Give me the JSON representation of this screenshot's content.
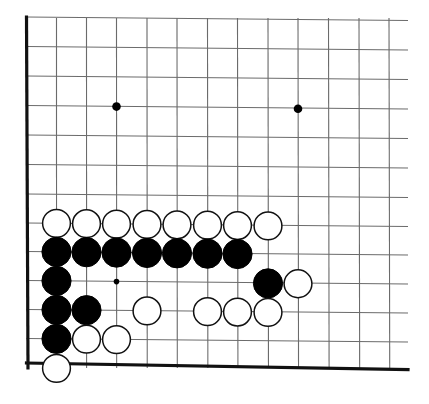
{
  "board": {
    "title": "Go board diagram",
    "type": "go-board-position",
    "board_size": 19,
    "view": "bottom-left corner section, partial board",
    "colors": {
      "background": "#ffffff",
      "grid_line": "#6b6b6b",
      "border_line": "#111111",
      "black_stone": "#000000",
      "white_stone_fill": "#ffffff",
      "white_stone_edge": "#111111",
      "star_point": "#000000"
    },
    "geometry": {
      "col_x": [
        26.5,
        56.5,
        86.5,
        116.5,
        147,
        177,
        207.5,
        237.5,
        268,
        298,
        328.5,
        359,
        389
      ],
      "row_y": [
        17,
        46.5,
        76,
        105.5,
        135,
        164.5,
        194,
        223,
        251.5,
        280.5,
        309.5,
        338.5,
        368
      ],
      "stone_radius": 14.6,
      "left_border_col_index": 0,
      "bottom_border_row_index": 12,
      "top_edge_y": 27,
      "grid_line_width": 1.1,
      "border_line_width": 3.2
    },
    "star_points": [
      {
        "col": 3,
        "row": 3,
        "size": "large"
      },
      {
        "col": 9,
        "row": 3,
        "size": "large"
      },
      {
        "col": 3,
        "row": 9,
        "size": "small"
      }
    ],
    "stones": [
      {
        "color": "white",
        "col": 1,
        "row": 7
      },
      {
        "color": "white",
        "col": 2,
        "row": 7
      },
      {
        "color": "white",
        "col": 3,
        "row": 7
      },
      {
        "color": "white",
        "col": 4,
        "row": 7
      },
      {
        "color": "white",
        "col": 5,
        "row": 7
      },
      {
        "color": "white",
        "col": 6,
        "row": 7
      },
      {
        "color": "white",
        "col": 7,
        "row": 7
      },
      {
        "color": "white",
        "col": 8,
        "row": 7
      },
      {
        "color": "black",
        "col": 1,
        "row": 8
      },
      {
        "color": "black",
        "col": 2,
        "row": 8
      },
      {
        "color": "black",
        "col": 3,
        "row": 8
      },
      {
        "color": "black",
        "col": 4,
        "row": 8
      },
      {
        "color": "black",
        "col": 5,
        "row": 8
      },
      {
        "color": "black",
        "col": 6,
        "row": 8
      },
      {
        "color": "black",
        "col": 7,
        "row": 8
      },
      {
        "color": "black",
        "col": 1,
        "row": 9
      },
      {
        "color": "black",
        "col": 8,
        "row": 9
      },
      {
        "color": "white",
        "col": 9,
        "row": 9
      },
      {
        "color": "black",
        "col": 1,
        "row": 10
      },
      {
        "color": "black",
        "col": 2,
        "row": 10
      },
      {
        "color": "white",
        "col": 4,
        "row": 10
      },
      {
        "color": "white",
        "col": 6,
        "row": 10
      },
      {
        "color": "white",
        "col": 7,
        "row": 10
      },
      {
        "color": "white",
        "col": 8,
        "row": 10
      },
      {
        "color": "black",
        "col": 1,
        "row": 11
      },
      {
        "color": "white",
        "col": 2,
        "row": 11
      },
      {
        "color": "white",
        "col": 3,
        "row": 11
      },
      {
        "color": "white",
        "col": 1,
        "row": 12
      }
    ],
    "counts": {
      "black_stones": 13,
      "white_stones": 16,
      "total_stones": 29
    }
  }
}
